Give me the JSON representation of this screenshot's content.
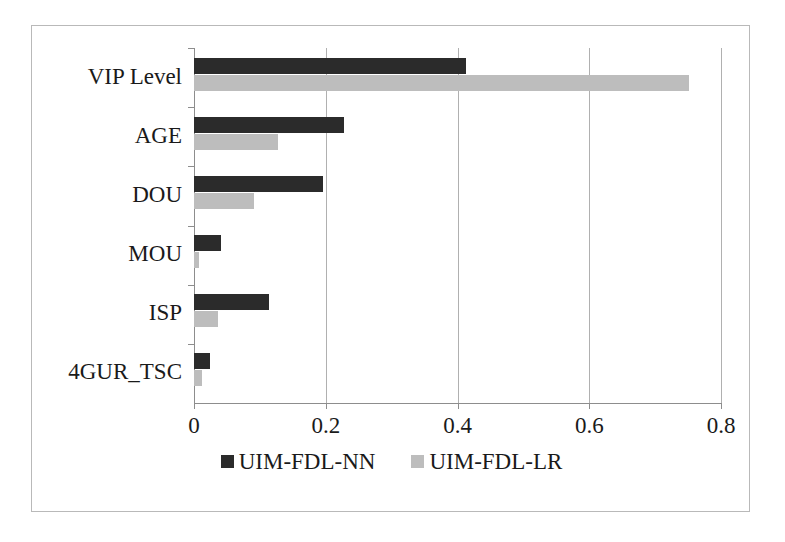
{
  "chart_data": {
    "type": "bar",
    "orientation": "horizontal",
    "title": "",
    "xlabel": "",
    "ylabel": "",
    "categories": [
      "VIP Level",
      "AGE",
      "DOU",
      "MOU",
      "ISP",
      "4GUR_TSC"
    ],
    "series": [
      {
        "name": "UIM-FDL-NN",
        "color": "#2b2b2b",
        "values": [
          0.413,
          0.228,
          0.196,
          0.041,
          0.114,
          0.024
        ]
      },
      {
        "name": "UIM-FDL-LR",
        "color": "#bdbdbd",
        "values": [
          0.751,
          0.128,
          0.091,
          0.008,
          0.036,
          0.012
        ]
      }
    ],
    "xlim": [
      0,
      0.8
    ],
    "xticks": [
      "0",
      "0.2",
      "0.4",
      "0.6",
      "0.8"
    ],
    "xtick_values": [
      0,
      0.2,
      0.4,
      0.6,
      0.8
    ],
    "grid": "vertical",
    "legend_position": "bottom"
  },
  "legend": {
    "entries": [
      {
        "label": "UIM-FDL-NN",
        "color": "#2b2b2b"
      },
      {
        "label": "UIM-FDL-LR",
        "color": "#bdbdbd"
      }
    ]
  },
  "colors": {
    "series_nn": "#2b2b2b",
    "series_lr": "#bdbdbd",
    "axis": "#8d8d8d",
    "gridline": "#b0b0b0",
    "frame": "#b9b9b9",
    "background": "#ffffff"
  }
}
